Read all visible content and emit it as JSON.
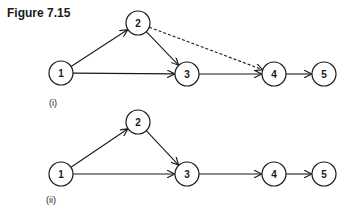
{
  "title": "Figure 7.15",
  "figures": [
    {
      "label": "(i)",
      "nodes": [
        {
          "id": "1",
          "x": 61,
          "y": 73
        },
        {
          "id": "2",
          "x": 138,
          "y": 23
        },
        {
          "id": "3",
          "x": 187,
          "y": 74
        },
        {
          "id": "4",
          "x": 274,
          "y": 74
        },
        {
          "id": "5",
          "x": 324,
          "y": 74
        }
      ],
      "edges": [
        {
          "from": "1",
          "to": "2",
          "style": "solid"
        },
        {
          "from": "1",
          "to": "3",
          "style": "solid"
        },
        {
          "from": "2",
          "to": "3",
          "style": "solid"
        },
        {
          "from": "2",
          "to": "4",
          "style": "dashed"
        },
        {
          "from": "3",
          "to": "4",
          "style": "solid"
        },
        {
          "from": "4",
          "to": "5",
          "style": "solid"
        }
      ]
    },
    {
      "label": "(ii)",
      "nodes": [
        {
          "id": "1",
          "x": 61,
          "y": 174
        },
        {
          "id": "2",
          "x": 138,
          "y": 122
        },
        {
          "id": "3",
          "x": 187,
          "y": 174
        },
        {
          "id": "4",
          "x": 274,
          "y": 174
        },
        {
          "id": "5",
          "x": 324,
          "y": 174
        }
      ],
      "edges": [
        {
          "from": "1",
          "to": "2",
          "style": "solid"
        },
        {
          "from": "1",
          "to": "3",
          "style": "solid"
        },
        {
          "from": "2",
          "to": "3",
          "style": "solid"
        },
        {
          "from": "3",
          "to": "4",
          "style": "solid"
        },
        {
          "from": "4",
          "to": "5",
          "style": "solid"
        }
      ]
    }
  ],
  "node_radius": 12
}
